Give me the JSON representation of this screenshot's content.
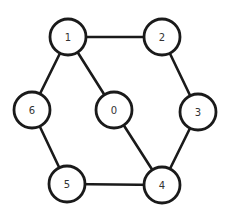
{
  "graph": {
    "nodes": [
      {
        "id": "0",
        "label": "0",
        "x": 114,
        "y": 110
      },
      {
        "id": "1",
        "label": "1",
        "x": 68,
        "y": 37
      },
      {
        "id": "2",
        "label": "2",
        "x": 162,
        "y": 37
      },
      {
        "id": "3",
        "label": "3",
        "x": 198,
        "y": 112
      },
      {
        "id": "4",
        "label": "4",
        "x": 162,
        "y": 185
      },
      {
        "id": "5",
        "label": "5",
        "x": 67,
        "y": 184
      },
      {
        "id": "6",
        "label": "6",
        "x": 32,
        "y": 110
      }
    ],
    "edges": [
      {
        "from": "1",
        "to": "2"
      },
      {
        "from": "1",
        "to": "6"
      },
      {
        "from": "1",
        "to": "0"
      },
      {
        "from": "2",
        "to": "3"
      },
      {
        "from": "3",
        "to": "4"
      },
      {
        "from": "0",
        "to": "4"
      },
      {
        "from": "6",
        "to": "5"
      },
      {
        "from": "5",
        "to": "4"
      }
    ],
    "node_radius": 18,
    "colors": {
      "stroke": "#1a1a1a",
      "fill": "#ffffff",
      "text": "#333333"
    }
  }
}
